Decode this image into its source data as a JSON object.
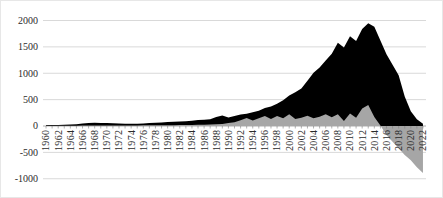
{
  "figure": {
    "background": "#ffffff",
    "border_color": "#e7e7e7"
  },
  "chart_data": {
    "type": "area",
    "title": "",
    "xlabel": "",
    "ylabel": "",
    "x": [
      1960,
      1961,
      1962,
      1963,
      1964,
      1965,
      1966,
      1967,
      1968,
      1969,
      1970,
      1971,
      1972,
      1973,
      1974,
      1975,
      1976,
      1977,
      1978,
      1979,
      1980,
      1981,
      1982,
      1983,
      1984,
      1985,
      1986,
      1987,
      1988,
      1989,
      1990,
      1991,
      1992,
      1993,
      1994,
      1995,
      1996,
      1997,
      1998,
      1999,
      2000,
      2001,
      2002,
      2003,
      2004,
      2005,
      2006,
      2007,
      2008,
      2009,
      2010,
      2011,
      2012,
      2013,
      2014,
      2015,
      2016,
      2017,
      2018,
      2019,
      2020,
      2021,
      2022
    ],
    "xtick_labels": [
      "1960",
      "1962",
      "1964",
      "1966",
      "1968",
      "1970",
      "1972",
      "1974",
      "1976",
      "1978",
      "1980",
      "1982",
      "1984",
      "1986",
      "1988",
      "1990",
      "1992",
      "1994",
      "1996",
      "1998",
      "2000",
      "2002",
      "2004",
      "2006",
      "2008",
      "2010",
      "2012",
      "2014",
      "2016",
      "2018",
      "2020",
      "2022"
    ],
    "series": [
      {
        "name": "black-area",
        "color": "#000000",
        "values": [
          15,
          18,
          20,
          24,
          28,
          35,
          48,
          55,
          60,
          58,
          55,
          50,
          46,
          45,
          42,
          42,
          46,
          55,
          60,
          65,
          75,
          80,
          85,
          92,
          100,
          112,
          120,
          128,
          170,
          200,
          160,
          190,
          220,
          230,
          260,
          290,
          340,
          370,
          420,
          490,
          580,
          640,
          710,
          860,
          1010,
          1110,
          1240,
          1370,
          1580,
          1490,
          1700,
          1610,
          1840,
          1950,
          1880,
          1620,
          1360,
          1160,
          960,
          560,
          280,
          130,
          45
        ]
      },
      {
        "name": "gray-area",
        "color": "#a6a6a6",
        "values": [
          2,
          3,
          3,
          4,
          5,
          6,
          8,
          10,
          10,
          10,
          10,
          10,
          10,
          10,
          10,
          10,
          12,
          12,
          14,
          15,
          15,
          16,
          18,
          18,
          20,
          22,
          25,
          28,
          32,
          40,
          55,
          70,
          110,
          150,
          105,
          145,
          190,
          135,
          190,
          145,
          225,
          135,
          155,
          195,
          145,
          175,
          225,
          165,
          225,
          95,
          235,
          155,
          330,
          400,
          170,
          10,
          -170,
          -300,
          -420,
          -550,
          -650,
          -780,
          -890
        ]
      }
    ],
    "ylim": [
      -1000,
      2000
    ],
    "yticks": [
      2000,
      1500,
      1000,
      500,
      0,
      -500,
      -1000
    ],
    "grid": true,
    "legend": "none",
    "gridline_color": "#d9d9d9",
    "axis_color": "#9a9a9a",
    "tick_color": "#808080",
    "label_color": "#2b2b2b"
  }
}
